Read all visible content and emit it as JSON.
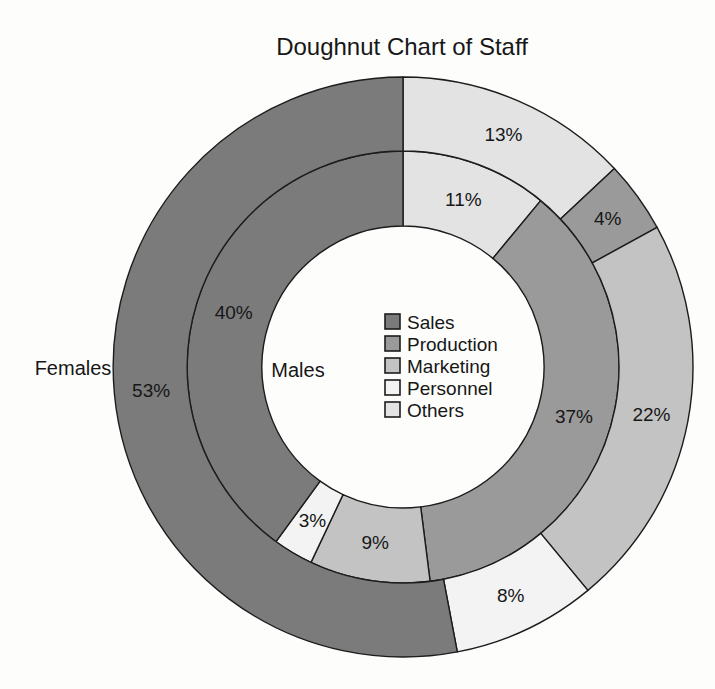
{
  "chart_data": {
    "type": "doughnut",
    "title": "Doughnut Chart of Staff",
    "unit": "%",
    "direction": "clockwise",
    "start_angle_deg": 0,
    "grid": false,
    "categories": [
      {
        "label": "Sales",
        "color": "#7b7b7b"
      },
      {
        "label": "Production",
        "color": "#9a9a9a"
      },
      {
        "label": "Marketing",
        "color": "#c3c3c3"
      },
      {
        "label": "Personnel",
        "color": "#f3f3f3"
      },
      {
        "label": "Others",
        "color": "#e3e3e3"
      }
    ],
    "legend": {
      "position": "center-of-hole",
      "entries": [
        "Sales",
        "Production",
        "Marketing",
        "Personnel",
        "Others"
      ]
    },
    "rings": [
      {
        "name": "Males",
        "position": "inner",
        "label": "Males",
        "segments": [
          {
            "category": "Others",
            "value": 11
          },
          {
            "category": "Production",
            "value": 37
          },
          {
            "category": "Marketing",
            "value": 9
          },
          {
            "category": "Personnel",
            "value": 3
          },
          {
            "category": "Sales",
            "value": 40
          }
        ]
      },
      {
        "name": "Females",
        "position": "outer",
        "label": "Females",
        "segments": [
          {
            "category": "Others",
            "value": 13
          },
          {
            "category": "Production",
            "value": 4
          },
          {
            "category": "Marketing",
            "value": 22
          },
          {
            "category": "Personnel",
            "value": 8
          },
          {
            "category": "Sales",
            "value": 53
          }
        ]
      }
    ],
    "outline_color": "#1c1c1c",
    "text_color": "#171717"
  }
}
